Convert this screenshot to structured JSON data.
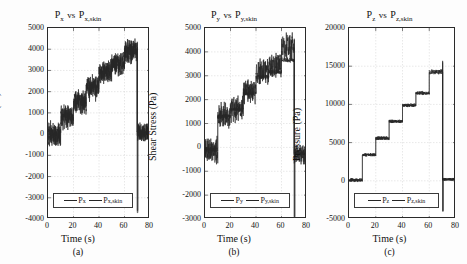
{
  "figure": {
    "background": "#ffffff",
    "line_color": "#262626",
    "grid_color": "#d0d0d0"
  },
  "panels": [
    {
      "id": "a",
      "caption": "(a)",
      "title_main": "P",
      "title_sub1": "x",
      "title_vs": "vs",
      "title_main2": "P",
      "title_sub2": "x,skin",
      "ylabel": "Shear Stress (Pa)",
      "xlabel": "Time (s)",
      "yticks": [
        "5000",
        "4000",
        "3000",
        "2000",
        "1000",
        "0",
        "-1000",
        "-2000",
        "-3000",
        "-4000"
      ],
      "xticks": [
        "0",
        "20",
        "40",
        "60",
        "80"
      ],
      "legend": [
        {
          "main": "P",
          "sub": "x"
        },
        {
          "main": "P",
          "sub": "x,skin"
        }
      ]
    },
    {
      "id": "b",
      "caption": "(b)",
      "title_main": "P",
      "title_sub1": "y",
      "title_vs": "vs",
      "title_main2": "P",
      "title_sub2": "y,skin",
      "ylabel": "Shear Stress (Pa)",
      "xlabel": "Time (s)",
      "yticks": [
        "5000",
        "4000",
        "3000",
        "2000",
        "1000",
        "0",
        "-1000",
        "-2000",
        "-3000"
      ],
      "xticks": [
        "0",
        "20",
        "40",
        "60",
        "80"
      ],
      "legend": [
        {
          "main": "P",
          "sub": "y"
        },
        {
          "main": "P",
          "sub": "y,skin"
        }
      ]
    },
    {
      "id": "c",
      "caption": "(c)",
      "title_main": "P",
      "title_sub1": "z",
      "title_vs": "vs",
      "title_main2": "P",
      "title_sub2": "z,skin",
      "ylabel": "Pressure (Pa)",
      "xlabel": "Time (s)",
      "yticks": [
        "20000",
        "15000",
        "10000",
        "5000",
        "0",
        "-5000"
      ],
      "xticks": [
        "0",
        "20",
        "40",
        "60",
        "80"
      ],
      "legend": [
        {
          "main": "P",
          "sub": "z"
        },
        {
          "main": "P",
          "sub": "z,skin"
        }
      ]
    }
  ],
  "chart_data": [
    {
      "type": "line",
      "panel": "a",
      "title": "P_x vs P_x,skin",
      "xlabel": "Time (s)",
      "ylabel": "Shear Stress (Pa)",
      "xlim": [
        0,
        80
      ],
      "ylim": [
        -4000,
        5000
      ],
      "ytick_step": 1000,
      "xtick_step": 20,
      "grid": true,
      "legend_position": "lower-left",
      "description": "Noisy ramping staircase of shear stress rising from ~0 Pa to ~4000 Pa over 0-70 s, then a sharp vertical drop at t=70 s down to about -3700 Pa before settling near 0 Pa with residual noise until 80 s.",
      "series": [
        {
          "name": "P_x",
          "noise_amplitude": 450,
          "steps": [
            {
              "t_start": 0,
              "t_end": 10,
              "level": 0
            },
            {
              "t_start": 10,
              "t_end": 20,
              "level": 800
            },
            {
              "t_start": 20,
              "t_end": 30,
              "level": 1500
            },
            {
              "t_start": 30,
              "t_end": 40,
              "level": 2200
            },
            {
              "t_start": 40,
              "t_end": 50,
              "level": 2900
            },
            {
              "t_start": 50,
              "t_end": 60,
              "level": 3300
            },
            {
              "t_start": 60,
              "t_end": 70,
              "level": 3900
            },
            {
              "t_start": 70,
              "t_end": 80,
              "level": 100
            }
          ],
          "drop": {
            "t": 70,
            "min": -3700,
            "max": 4350
          }
        },
        {
          "name": "P_x,skin",
          "noise_amplitude": 380,
          "steps": [
            {
              "t_start": 0,
              "t_end": 10,
              "level": 0
            },
            {
              "t_start": 10,
              "t_end": 20,
              "level": 850
            },
            {
              "t_start": 20,
              "t_end": 30,
              "level": 1550
            },
            {
              "t_start": 30,
              "t_end": 40,
              "level": 2250
            },
            {
              "t_start": 40,
              "t_end": 50,
              "level": 2950
            },
            {
              "t_start": 50,
              "t_end": 60,
              "level": 3350
            },
            {
              "t_start": 60,
              "t_end": 70,
              "level": 3950
            },
            {
              "t_start": 70,
              "t_end": 80,
              "level": 120
            }
          ],
          "drop": {
            "t": 70,
            "min": -3600,
            "max": 4300
          }
        }
      ]
    },
    {
      "type": "line",
      "panel": "b",
      "title": "P_y vs P_y,skin",
      "xlabel": "Time (s)",
      "ylabel": "Shear Stress (Pa)",
      "xlim": [
        0,
        80
      ],
      "ylim": [
        -3000,
        5000
      ],
      "ytick_step": 1000,
      "xtick_step": 20,
      "grid": true,
      "legend_position": "lower-left",
      "description": "Noisy staircase of shear stress with flat plateaus at approximately 0, 1300, 2300, 3150, 3400 and 4200 Pa between 0 and 70 s; at t=70 s a vertical spike reaching ~4500 Pa then falling below -2900 Pa, after which the signal oscillates near -300 Pa until 80 s. The skin trace is smoother and sits slightly below the main trace in the later steps.",
      "series": [
        {
          "name": "P_y",
          "noise_amplitude": 420,
          "steps": [
            {
              "t_start": 0,
              "t_end": 10,
              "level": -100
            },
            {
              "t_start": 10,
              "t_end": 20,
              "level": 1300
            },
            {
              "t_start": 20,
              "t_end": 30,
              "level": 1600
            },
            {
              "t_start": 30,
              "t_end": 40,
              "level": 2350
            },
            {
              "t_start": 40,
              "t_end": 50,
              "level": 3150
            },
            {
              "t_start": 50,
              "t_end": 60,
              "level": 3400
            },
            {
              "t_start": 60,
              "t_end": 70,
              "level": 4200
            },
            {
              "t_start": 70,
              "t_end": 80,
              "level": -300
            }
          ],
          "drop": {
            "t": 70,
            "min": -2950,
            "max": 4550
          }
        },
        {
          "name": "P_y,skin",
          "noise_amplitude": 80,
          "steps": [
            {
              "t_start": 0,
              "t_end": 10,
              "level": -80
            },
            {
              "t_start": 10,
              "t_end": 20,
              "level": 1300
            },
            {
              "t_start": 20,
              "t_end": 30,
              "level": 1600
            },
            {
              "t_start": 30,
              "t_end": 40,
              "level": 2250
            },
            {
              "t_start": 40,
              "t_end": 50,
              "level": 2950
            },
            {
              "t_start": 50,
              "t_end": 60,
              "level": 3150
            },
            {
              "t_start": 60,
              "t_end": 70,
              "level": 3650
            },
            {
              "t_start": 70,
              "t_end": 80,
              "level": -250
            }
          ],
          "drop": {
            "t": 70,
            "min": -2900,
            "max": 4500
          }
        }
      ]
    },
    {
      "type": "line",
      "panel": "c",
      "title": "P_z vs P_z,skin",
      "xlabel": "Time (s)",
      "ylabel": "Pressure (Pa)",
      "xlim": [
        0,
        80
      ],
      "ylim": [
        -5000,
        20000
      ],
      "ytick_step": 5000,
      "xtick_step": 20,
      "grid": true,
      "legend_position": "lower-left",
      "description": "Clean staircase of pressure rising through plateaus at roughly 0, 3400, 5600, 7800, 9900, 11500 and 14200 Pa between 0 and 70 s; at t=70 s a spike to ~15700 Pa is followed by a vertical drop to about -4000 Pa, then the trace returns to near 0 Pa through 80 s.",
      "series": [
        {
          "name": "P_z",
          "noise_amplitude": 180,
          "steps": [
            {
              "t_start": 0,
              "t_end": 10,
              "level": 100
            },
            {
              "t_start": 10,
              "t_end": 20,
              "level": 3400
            },
            {
              "t_start": 20,
              "t_end": 30,
              "level": 5600
            },
            {
              "t_start": 30,
              "t_end": 40,
              "level": 7800
            },
            {
              "t_start": 40,
              "t_end": 50,
              "level": 9900
            },
            {
              "t_start": 50,
              "t_end": 60,
              "level": 11500
            },
            {
              "t_start": 60,
              "t_end": 70,
              "level": 14200
            },
            {
              "t_start": 70,
              "t_end": 80,
              "level": 200
            }
          ],
          "drop": {
            "t": 70,
            "min": -4000,
            "max": 15700
          }
        },
        {
          "name": "P_z,skin",
          "noise_amplitude": 150,
          "steps": [
            {
              "t_start": 0,
              "t_end": 10,
              "level": 80
            },
            {
              "t_start": 10,
              "t_end": 20,
              "level": 3400
            },
            {
              "t_start": 20,
              "t_end": 30,
              "level": 5550
            },
            {
              "t_start": 30,
              "t_end": 40,
              "level": 7750
            },
            {
              "t_start": 40,
              "t_end": 50,
              "level": 9850
            },
            {
              "t_start": 50,
              "t_end": 60,
              "level": 11450
            },
            {
              "t_start": 60,
              "t_end": 70,
              "level": 14400
            },
            {
              "t_start": 70,
              "t_end": 80,
              "level": 180
            }
          ],
          "drop": {
            "t": 70,
            "min": -3900,
            "max": 15500
          }
        }
      ]
    }
  ]
}
